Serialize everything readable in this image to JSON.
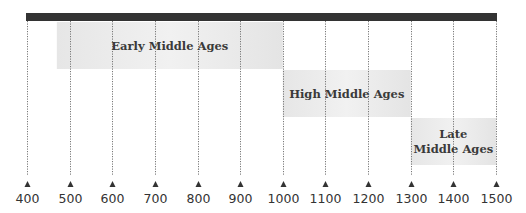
{
  "timeline": {
    "start_year": 400,
    "end_year": 1500,
    "tick_step": 100,
    "ticks": [
      "400",
      "500",
      "600",
      "700",
      "800",
      "900",
      "1000",
      "1100",
      "1200",
      "1300",
      "1400",
      "1500"
    ],
    "eras": [
      {
        "name": "Early Middle Ages",
        "lines": [
          "Early Middle Ages"
        ],
        "start": 470,
        "end": 1000
      },
      {
        "name": "High Middle Ages",
        "lines": [
          "High Middle Ages"
        ],
        "start": 1000,
        "end": 1300
      },
      {
        "name": "Late Middle Ages",
        "lines": [
          "Late",
          "Middle Ages"
        ],
        "start": 1300,
        "end": 1500
      }
    ],
    "colors": {
      "bar": "#333333",
      "era_fill": "#e9e9e9",
      "gridline": "#777777",
      "marker": "#333333",
      "text": "#333333"
    }
  }
}
